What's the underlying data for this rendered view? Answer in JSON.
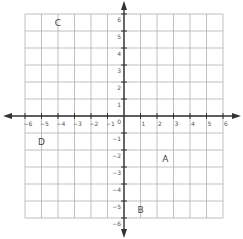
{
  "chart_data": {
    "type": "scatter",
    "title": "",
    "xlabel": "",
    "ylabel": "",
    "xlim": [
      -6,
      6
    ],
    "ylim": [
      -6,
      6
    ],
    "grid": true,
    "x_ticks": [
      "-6",
      "-5",
      "-4",
      "-3",
      "-2",
      "-1",
      "1",
      "2",
      "3",
      "4",
      "5",
      "6"
    ],
    "y_ticks": [
      "6",
      "5",
      "4",
      "3",
      "2",
      "1",
      "0",
      "-1",
      "-2",
      "-3",
      "-4",
      "-5",
      "-6"
    ],
    "points": [
      {
        "label": "A",
        "x": 2.5,
        "y": -2.5
      },
      {
        "label": "B",
        "x": 1,
        "y": -5.5
      },
      {
        "label": "C",
        "x": -4,
        "y": 5.5
      },
      {
        "label": "D",
        "x": -5,
        "y": -1.5
      }
    ]
  },
  "colors": {
    "grid": "#b0b0b0",
    "axis": "#333333",
    "text": "#555555"
  }
}
